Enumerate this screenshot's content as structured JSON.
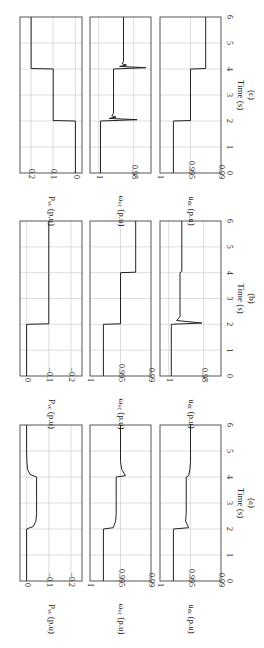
{
  "figure": {
    "rotation": "90deg clockwise",
    "xlabel": "Time (s)",
    "x_ticks": [
      "0",
      "1",
      "2",
      "3",
      "4",
      "5",
      "6"
    ]
  },
  "panels": [
    {
      "caption": "(a)",
      "rows": [
        {
          "ylabel": "P_vc (p.u)",
          "ylabel_main": "P",
          "ylabel_sub": "vc",
          "ylabel_unit": " (p.u)",
          "ticks": [
            "0",
            "−0.1",
            "−0.2"
          ],
          "tick_values": [
            0,
            -0.1,
            -0.2
          ],
          "ylim": [
            -0.25,
            0.03
          ]
        },
        {
          "ylabel": "ω_vc (p.u)",
          "ylabel_main": "ω",
          "ylabel_sub": "vc",
          "ylabel_unit": " (p.u)",
          "ticks": [
            "1",
            "0.995",
            "0.99"
          ],
          "tick_values": [
            1,
            0.995,
            0.99
          ],
          "ylim": [
            0.99,
            1.0
          ]
        },
        {
          "ylabel": "u_dc (p.u)",
          "ylabel_main": "u",
          "ylabel_sub": "dc",
          "ylabel_unit": " (p.u)",
          "ticks": [
            "1",
            "0.995",
            "0.99"
          ],
          "tick_values": [
            1,
            0.995,
            0.99
          ],
          "ylim": [
            0.99,
            1.0
          ]
        }
      ]
    },
    {
      "caption": "(b)",
      "rows": [
        {
          "ylabel": "P_vc (p.u)",
          "ylabel_main": "P",
          "ylabel_sub": "vc",
          "ylabel_unit": " (p.u)",
          "ticks": [
            "0",
            "−0.1",
            "−0.2"
          ],
          "tick_values": [
            0,
            -0.1,
            -0.2
          ],
          "ylim": [
            -0.25,
            0.03
          ]
        },
        {
          "ylabel": "ω_vc (p.u)",
          "ylabel_main": "ω",
          "ylabel_sub": "vc",
          "ylabel_unit": " (p.u)",
          "ticks": [
            "1",
            "0.995",
            "0.99"
          ],
          "tick_values": [
            1,
            0.995,
            0.99
          ],
          "ylim": [
            0.99,
            1.0
          ]
        },
        {
          "ylabel": "u_dc (p.u)",
          "ylabel_main": "u",
          "ylabel_sub": "dc",
          "ylabel_unit": " (p.u)",
          "ticks": [
            "1",
            "0.98"
          ],
          "tick_values": [
            1,
            0.98
          ],
          "ylim": [
            0.97,
            1.005
          ]
        }
      ]
    },
    {
      "caption": "(c)",
      "rows": [
        {
          "ylabel": "P_vc (p.u)",
          "ylabel_main": "P",
          "ylabel_sub": "vc",
          "ylabel_unit": " (p.u)",
          "ticks": [
            "0.2",
            "0.1",
            "0"
          ],
          "tick_values": [
            0.2,
            0.1,
            0
          ],
          "ylim": [
            -0.03,
            0.25
          ]
        },
        {
          "ylabel": "ω_vc (p.u)",
          "ylabel_main": "ω",
          "ylabel_sub": "vc",
          "ylabel_unit": " (p.u)",
          "ticks": [
            "1",
            "0.98"
          ],
          "tick_values": [
            1,
            0.98
          ],
          "ylim": [
            0.97,
            1.005
          ]
        },
        {
          "ylabel": "u_dc (p.u)",
          "ylabel_main": "u",
          "ylabel_sub": "dc",
          "ylabel_unit": " (p.u)",
          "ticks": [
            "1",
            "0.995",
            "0.99"
          ],
          "tick_values": [
            1,
            0.995,
            0.99
          ],
          "ylim": [
            0.99,
            1.0
          ]
        }
      ]
    }
  ],
  "chart_data": [
    {
      "type": "line",
      "title": "(a)",
      "xlabel": "Time (s)",
      "xlim": [
        0,
        6
      ],
      "grid": true,
      "series": [
        {
          "name": "P_vc (p.u)",
          "ylim": [
            -0.25,
            0.03
          ],
          "x": [
            0,
            2,
            2.1,
            2.3,
            2.6,
            3,
            4,
            4.1,
            4.3,
            4.6,
            5,
            6
          ],
          "values": [
            0,
            0,
            -0.03,
            -0.042,
            -0.045,
            -0.045,
            -0.045,
            -0.015,
            -0.004,
            -0.001,
            0,
            0
          ]
        },
        {
          "name": "ω_vc (p.u)",
          "ylim": [
            0.99,
            1.0
          ],
          "x": [
            0,
            2,
            2.05,
            2.3,
            2.6,
            3,
            4,
            4.05,
            4.3,
            4.6,
            5,
            6
          ],
          "values": [
            0.9978,
            0.9978,
            0.9962,
            0.9958,
            0.9957,
            0.9957,
            0.9957,
            0.9942,
            0.9948,
            0.995,
            0.995,
            0.995
          ]
        },
        {
          "name": "u_dc (p.u)",
          "ylim": [
            0.99,
            1.0
          ],
          "x": [
            0,
            2,
            2.05,
            2.3,
            2.6,
            3,
            4,
            4.05,
            4.3,
            4.6,
            5,
            6
          ],
          "values": [
            0.9978,
            0.9978,
            0.9953,
            0.9958,
            0.9957,
            0.9957,
            0.9957,
            0.9953,
            0.9951,
            0.995,
            0.995,
            0.995
          ]
        }
      ]
    },
    {
      "type": "line",
      "title": "(b)",
      "xlabel": "Time (s)",
      "xlim": [
        0,
        6
      ],
      "grid": true,
      "series": [
        {
          "name": "P_vc (p.u)",
          "ylim": [
            -0.25,
            0.03
          ],
          "x": [
            0,
            2,
            2.02,
            2.1,
            4,
            4.02,
            6
          ],
          "values": [
            0,
            0,
            -0.1,
            -0.1,
            -0.1,
            -0.1,
            -0.1
          ]
        },
        {
          "name": "ω_vc (p.u)",
          "ylim": [
            0.99,
            1.0
          ],
          "x": [
            0,
            2,
            2.02,
            4,
            4.02,
            6
          ],
          "values": [
            0.9978,
            0.9978,
            0.995,
            0.995,
            0.9925,
            0.9925
          ]
        },
        {
          "name": "u_dc (p.u)",
          "ylim": [
            0.97,
            1.005
          ],
          "x": [
            0,
            2,
            2.05,
            2.15,
            2.3,
            4,
            4.05,
            6
          ],
          "values": [
            0.9985,
            0.9985,
            0.981,
            0.9955,
            0.9935,
            0.9935,
            0.9925,
            0.9925
          ]
        }
      ]
    },
    {
      "type": "line",
      "title": "(c)",
      "xlabel": "Time (s)",
      "xlim": [
        0,
        6
      ],
      "grid": true,
      "series": [
        {
          "name": "P_vc (p.u)",
          "ylim": [
            -0.03,
            0.25
          ],
          "x": [
            0,
            2,
            2.02,
            4,
            4.02,
            6
          ],
          "values": [
            0,
            0,
            0.1,
            0.1,
            0.2,
            0.2
          ]
        },
        {
          "name": "ω_vc (p.u)",
          "ylim": [
            0.97,
            1.005
          ],
          "x": [
            0,
            2,
            2.05,
            2.1,
            2.15,
            2.2,
            2.3,
            4,
            4.05,
            4.1,
            4.15,
            4.2,
            4.3,
            6
          ],
          "values": [
            0.999,
            0.999,
            0.978,
            0.994,
            0.99,
            0.9925,
            0.9915,
            0.9915,
            0.973,
            0.988,
            0.984,
            0.9865,
            0.9858,
            0.9858
          ]
        },
        {
          "name": "u_dc (p.u)",
          "ylim": [
            0.99,
            1.0
          ],
          "x": [
            0,
            2,
            2.02,
            4,
            4.02,
            6
          ],
          "values": [
            0.9978,
            0.9978,
            0.995,
            0.995,
            0.9925,
            0.9925
          ]
        }
      ]
    }
  ]
}
